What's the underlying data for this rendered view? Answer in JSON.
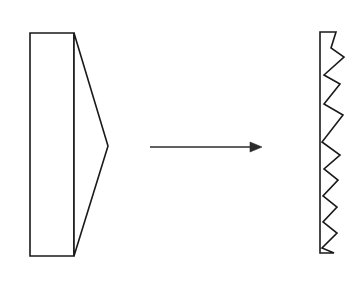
{
  "diagram": {
    "background_color": "#ffffff",
    "stroke_color": "#1a1a1a",
    "arrow_color": "#2b2b2b",
    "canvas": {
      "width": 364,
      "height": 289
    },
    "left_shape": {
      "name": "wedge-prism",
      "description": "Rectangular block with triangular wedge taper to a point on the right",
      "rect_points": "30,33 74,33 74,256 30,256",
      "wedge_points": "74,33 108,146 74,256",
      "rect_left_x": 30,
      "rect_right_x": 74,
      "rect_top_y": 33,
      "rect_bottom_y": 256,
      "apex_x": 108,
      "apex_y": 146
    },
    "arrow": {
      "name": "transformation-arrow",
      "direction": "right",
      "shaft_points": "150,147 256,147",
      "head_points": "262,147 250,142 250,152",
      "start_x": 150,
      "end_x": 262,
      "y": 147
    },
    "right_shape": {
      "name": "sawtooth-strip",
      "description": "Vertical strip with sawtooth serrated right edge",
      "left_x": 320,
      "top_y": 32,
      "bottom_y": 253,
      "tooth_tip_x": 344,
      "outline_points": "320,32 336,32 331,48 344,57 324,75 340,84 324,104 343,115 322,142 340,155 324,169 338,180 323,196 337,207 323,222 337,233 322,248 334,253 320,253",
      "teeth_count": 8
    }
  }
}
